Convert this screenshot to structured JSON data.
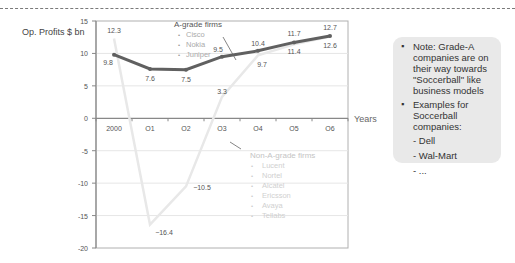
{
  "chart_data": {
    "type": "line",
    "title": "",
    "xlabel": "Years",
    "ylabel": "Op. Profits $ bn",
    "categories": [
      "2000",
      "O1",
      "O2",
      "O3",
      "O4",
      "O5",
      "O6"
    ],
    "ylim": [
      -20,
      15
    ],
    "yticks": [
      15,
      10,
      5,
      0,
      -5,
      -10,
      -15,
      -20
    ],
    "grid": true,
    "series": [
      {
        "name": "A-grade firms",
        "color": "#606060",
        "values": [
          9.8,
          7.6,
          7.5,
          9.5,
          10.4,
          11.7,
          12.7
        ],
        "alt_labels": [
          null,
          null,
          null,
          null,
          9.7,
          11.4,
          12.6
        ]
      },
      {
        "name": "Non-A-grade firms",
        "color": "#e8e8e8",
        "values": [
          12.3,
          -16.4,
          -10.5,
          3.3,
          9.7,
          11.4,
          12.6
        ]
      }
    ],
    "legend": {
      "a_grade": {
        "title": "A-grade firms",
        "items": [
          "Cisco",
          "Nokia",
          "Juniper"
        ]
      },
      "non_a_grade": {
        "title": "Non-A-grade firms",
        "items": [
          "Lucent",
          "Nortel",
          "Alcatel",
          "Ericsson",
          "Avaya",
          "Tellabs"
        ]
      }
    }
  },
  "labels": {
    "ylabel": "Op. Profits $ bn",
    "xlabel": "Years"
  },
  "note": {
    "bullet1": "Note: Grade-A companies are on their way towards \"Soccerball\" like business models",
    "bullet2": "Examples for Soccerball companies:",
    "sub": [
      "- Dell",
      "- Wal-Mart",
      "- ..."
    ]
  }
}
